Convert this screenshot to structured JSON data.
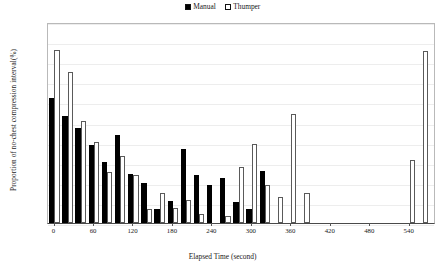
{
  "chart_data": {
    "type": "bar",
    "title": "",
    "xlabel": "Elapsed Time (second)",
    "ylabel": "Proportion of no-chest compression interval(%)",
    "ylim": [
      0,
      100
    ],
    "xlim": [
      -10,
      580
    ],
    "ytick_labels": [
      "0%",
      "10%",
      "20%",
      "30%",
      "40%",
      "50%",
      "60%",
      "70%",
      "80%",
      "90%",
      "100%"
    ],
    "ytick_values": [
      0,
      10,
      20,
      30,
      40,
      50,
      60,
      70,
      80,
      90,
      100
    ],
    "xtick_labels": [
      "0",
      "60",
      "120",
      "180",
      "240",
      "300",
      "360",
      "420",
      "480",
      "540"
    ],
    "xtick_values": [
      0,
      60,
      120,
      180,
      240,
      300,
      360,
      420,
      480,
      540
    ],
    "grid": "horizontal",
    "legend_position": "top-center",
    "bin_width": 20,
    "categories": [
      0,
      20,
      40,
      60,
      80,
      100,
      120,
      140,
      160,
      180,
      200,
      220,
      240,
      260,
      280,
      300,
      320,
      340,
      360,
      380,
      400,
      420,
      440,
      460,
      480,
      500,
      520,
      540,
      560
    ],
    "series": [
      {
        "name": "Manual",
        "color": "#000000",
        "style": "filled",
        "values": [
          62,
          53,
          47.5,
          39,
          30.5,
          44,
          24.5,
          20,
          7,
          11,
          37,
          24,
          19,
          22.5,
          10.5,
          7,
          26,
          null,
          null,
          null,
          null,
          null,
          null,
          null,
          null,
          null,
          null,
          null,
          null
        ]
      },
      {
        "name": "Thumper",
        "color": "#ffffff",
        "style": "hollow",
        "values": [
          86,
          75,
          51,
          40.5,
          25.5,
          33.5,
          24,
          7,
          15,
          7.5,
          11.5,
          4.5,
          null,
          3.5,
          28,
          39.5,
          19,
          13,
          54,
          15,
          null,
          null,
          null,
          null,
          null,
          null,
          null,
          31.5,
          85.5
        ]
      }
    ]
  },
  "legend": {
    "entries": [
      {
        "label": "Manual",
        "style": "filled"
      },
      {
        "label": "Thumper",
        "style": "hollow"
      }
    ]
  }
}
